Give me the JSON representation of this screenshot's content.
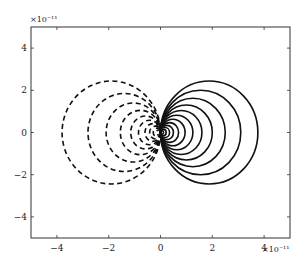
{
  "chart_data": {
    "type": "line",
    "title": "",
    "xlabel": "",
    "ylabel": "",
    "x_multiplier": "×10⁻¹¹",
    "y_multiplier": "×10⁻¹¹",
    "xlim": [
      -5,
      5
    ],
    "ylim": [
      -5,
      5
    ],
    "x_ticks": [
      -4,
      -2,
      0,
      2,
      4
    ],
    "y_ticks": [
      -4,
      -2,
      0,
      2,
      4
    ],
    "x_tick_labels": [
      "−4",
      "−2",
      "0",
      "2",
      "4"
    ],
    "y_tick_labels": [
      "−4",
      "−2",
      "0",
      "2",
      "4"
    ],
    "grid": false,
    "legend": null,
    "series": [
      {
        "name": "positive contours",
        "style": "solid",
        "color": "#111111",
        "ovals": [
          {
            "x_extent": 3.76,
            "y_half": 2.44
          },
          {
            "x_extent": 3.1,
            "y_half": 2.0
          },
          {
            "x_extent": 2.5,
            "y_half": 1.62
          },
          {
            "x_extent": 2.0,
            "y_half": 1.3
          },
          {
            "x_extent": 1.6,
            "y_half": 1.04
          },
          {
            "x_extent": 1.25,
            "y_half": 0.82
          },
          {
            "x_extent": 0.95,
            "y_half": 0.63
          },
          {
            "x_extent": 0.7,
            "y_half": 0.47
          },
          {
            "x_extent": 0.5,
            "y_half": 0.34
          },
          {
            "x_extent": 0.35,
            "y_half": 0.24
          },
          {
            "x_extent": 0.22,
            "y_half": 0.15
          },
          {
            "x_extent": 0.12,
            "y_half": 0.08
          }
        ]
      },
      {
        "name": "negative contours",
        "style": "dashed",
        "color": "#111111",
        "ovals": [
          {
            "x_extent": -3.8,
            "y_half": 2.44
          },
          {
            "x_extent": -2.8,
            "y_half": 1.85
          },
          {
            "x_extent": -2.1,
            "y_half": 1.4
          },
          {
            "x_extent": -1.55,
            "y_half": 1.05
          },
          {
            "x_extent": -1.15,
            "y_half": 0.78
          },
          {
            "x_extent": -0.85,
            "y_half": 0.58
          },
          {
            "x_extent": -0.6,
            "y_half": 0.42
          },
          {
            "x_extent": -0.42,
            "y_half": 0.3
          },
          {
            "x_extent": -0.28,
            "y_half": 0.2
          },
          {
            "x_extent": -0.16,
            "y_half": 0.12
          }
        ]
      }
    ]
  },
  "frame": {
    "left": 31,
    "top": 27,
    "right": 290,
    "bottom": 238
  }
}
